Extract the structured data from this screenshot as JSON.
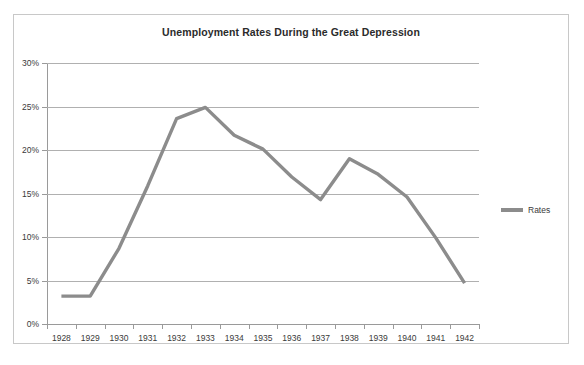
{
  "chart_data": {
    "type": "line",
    "title": "Unemployment Rates During the Great Depression",
    "xlabel": "",
    "ylabel": "",
    "categories": [
      "1928",
      "1929",
      "1930",
      "1931",
      "1932",
      "1933",
      "1934",
      "1935",
      "1936",
      "1937",
      "1938",
      "1939",
      "1940",
      "1941",
      "1942"
    ],
    "series": [
      {
        "name": "Rates",
        "color": "#8c8c8c",
        "values": [
          3.2,
          3.2,
          8.7,
          15.9,
          23.6,
          24.9,
          21.7,
          20.1,
          16.9,
          14.3,
          19.0,
          17.2,
          14.6,
          9.9,
          4.7
        ]
      }
    ],
    "ylim": [
      0,
      30
    ],
    "y_ticks": [
      0,
      5,
      10,
      15,
      20,
      25,
      30
    ],
    "y_tick_labels": [
      "0%",
      "5%",
      "10%",
      "15%",
      "20%",
      "25%",
      "30%"
    ],
    "grid": true,
    "legend_position": "right"
  },
  "legend": {
    "entries": [
      {
        "label": "Rates"
      }
    ]
  },
  "colors": {
    "series_line": "#8c8c8c",
    "gridline": "#b0b0b0",
    "axis": "#9a9a9a",
    "text": "#3a3a3a",
    "title_text": "#2b2b2b",
    "frame_border": "#c8c8c8",
    "background": "#ffffff"
  },
  "artifact": {
    "top_text": ""
  }
}
